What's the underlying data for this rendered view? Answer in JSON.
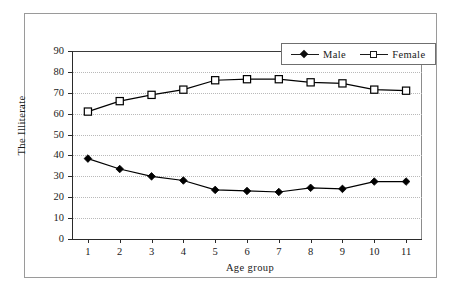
{
  "chart_data": {
    "type": "line",
    "title": "",
    "xlabel": "Age group",
    "ylabel": "The Illiterate",
    "categories": [
      "1",
      "2",
      "3",
      "4",
      "5",
      "6",
      "7",
      "8",
      "9",
      "10",
      "11"
    ],
    "x": [
      1,
      2,
      3,
      4,
      5,
      6,
      7,
      8,
      9,
      10,
      11
    ],
    "series": [
      {
        "name": "Male",
        "marker": "filled-diamond",
        "color": "#000000",
        "values": [
          38.5,
          33.5,
          30.0,
          28.0,
          23.5,
          23.0,
          22.5,
          24.5,
          24.0,
          27.5,
          27.5
        ]
      },
      {
        "name": "Female",
        "marker": "open-square",
        "color": "#000000",
        "values": [
          61.0,
          66.0,
          69.0,
          71.5,
          76.0,
          76.5,
          76.5,
          75.0,
          74.5,
          71.5,
          71.0
        ]
      }
    ],
    "ylim": [
      0,
      90
    ],
    "yticks": [
      0,
      10,
      20,
      30,
      40,
      50,
      60,
      70,
      80,
      90
    ],
    "ytick_labels": [
      "0",
      "10",
      "20",
      "30",
      "40",
      "50",
      "60",
      "70",
      "80",
      "90"
    ],
    "xtick_labels": [
      "1",
      "2",
      "3",
      "4",
      "5",
      "6",
      "7",
      "8",
      "9",
      "10",
      "11"
    ],
    "grid": "horizontal-dotted",
    "legend_position": "top-right",
    "legend_entries": [
      "Male",
      "Female"
    ]
  },
  "legend": {
    "male_label": "Male",
    "female_label": "Female"
  },
  "axes": {
    "x_title": "Age group",
    "y_title": "The Illiterate"
  }
}
